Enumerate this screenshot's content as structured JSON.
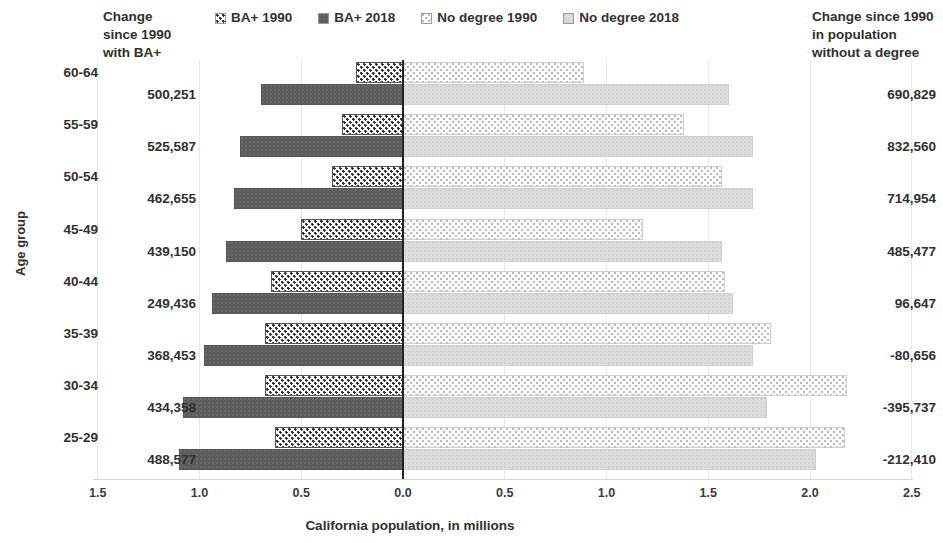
{
  "legend": {
    "items": [
      {
        "label": "BA+ 1990",
        "key": "ba1990",
        "swatch": "dotted-dark-swatch"
      },
      {
        "label": "BA+ 2018",
        "key": "ba2018",
        "swatch": "solid-dark-swatch"
      },
      {
        "label": "No degree 1990",
        "key": "nd1990",
        "swatch": "dotted-light-swatch"
      },
      {
        "label": "No degree 2018",
        "key": "nd2018",
        "swatch": "solid-light-swatch"
      }
    ]
  },
  "headers": {
    "left": [
      "Change",
      "since 1990",
      "with BA+"
    ],
    "right": [
      "Change since 1990",
      "in population",
      "without a degree"
    ]
  },
  "axes": {
    "y_title": "Age group",
    "x_title": "California population, in millions",
    "x_ticks": [
      "1.5",
      "1.0",
      "0.5",
      "0.0",
      "0.5",
      "1.0",
      "1.5",
      "2.0",
      "2.5"
    ],
    "x_tick_values": [
      -1.5,
      -1.0,
      -0.5,
      0.0,
      0.5,
      1.0,
      1.5,
      2.0,
      2.5
    ]
  },
  "chart_data": {
    "type": "bar",
    "title": "",
    "xlabel": "California population, in millions",
    "ylabel": "Age group",
    "orientation": "horizontal",
    "diverging": true,
    "xlim": [
      -1.5,
      2.5
    ],
    "grid": true,
    "legend_position": "top",
    "categories": [
      "60-64",
      "55-59",
      "50-54",
      "45-49",
      "40-44",
      "35-39",
      "30-34",
      "25-29"
    ],
    "series": [
      {
        "name": "BA+ 1990",
        "side": "left",
        "values": [
          0.23,
          0.3,
          0.35,
          0.5,
          0.65,
          0.68,
          0.68,
          0.63
        ]
      },
      {
        "name": "BA+ 2018",
        "side": "left",
        "values": [
          0.7,
          0.8,
          0.83,
          0.87,
          0.94,
          0.98,
          1.08,
          1.1
        ]
      },
      {
        "name": "No degree 1990",
        "side": "right",
        "values": [
          0.89,
          1.38,
          1.57,
          1.18,
          1.58,
          1.81,
          2.18,
          2.17
        ]
      },
      {
        "name": "No degree 2018",
        "side": "right",
        "values": [
          1.6,
          1.72,
          1.72,
          1.57,
          1.62,
          1.72,
          1.79,
          2.03
        ]
      }
    ],
    "left_labels": [
      "500,251",
      "525,587",
      "462,655",
      "439,150",
      "249,436",
      "368,453",
      "434,358",
      "488,577"
    ],
    "right_labels": [
      "690,829",
      "832,560",
      "714,954",
      "485,477",
      "96,647",
      "-80,656",
      "-395,737",
      "-212,410"
    ]
  },
  "colors": {
    "ba2018_fill": "#5c5c5c",
    "nd2018_fill": "#dcdcdc",
    "axis_line": "#222222",
    "gridline": "#e8e8e8",
    "text": "#2f2f2f"
  }
}
